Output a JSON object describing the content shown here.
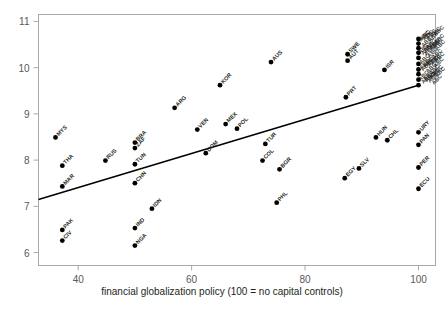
{
  "chart_data": {
    "type": "scatter",
    "title": "",
    "xlabel": "financial globalization policy (100 = no capital controls)",
    "ylabel": "",
    "xlim": [
      33,
      103
    ],
    "ylim": [
      5.72,
      11.15
    ],
    "xticks": [
      40,
      60,
      80,
      100
    ],
    "yticks": [
      6,
      7,
      8,
      9,
      10,
      11
    ],
    "grid": false,
    "legend": false,
    "trendline": {
      "label": "linear fit",
      "x_start": 33.0,
      "y_start": 7.15,
      "x_end": 100.0,
      "y_end": 9.62
    },
    "points": [
      {
        "label": "MYS",
        "x": 36.0,
        "y": 8.49
      },
      {
        "label": "THA",
        "x": 37.2,
        "y": 7.88
      },
      {
        "label": "MAR",
        "x": 37.2,
        "y": 7.43
      },
      {
        "label": "PAK",
        "x": 37.2,
        "y": 6.49
      },
      {
        "label": "CIV",
        "x": 37.2,
        "y": 6.26
      },
      {
        "label": "RUS",
        "x": 44.8,
        "y": 7.99
      },
      {
        "label": "BRA",
        "x": 50.0,
        "y": 8.38
      },
      {
        "label": "ZAF",
        "x": 50.0,
        "y": 8.26
      },
      {
        "label": "TUN",
        "x": 50.0,
        "y": 7.91
      },
      {
        "label": "CHN",
        "x": 50.0,
        "y": 7.5
      },
      {
        "label": "IND",
        "x": 50.0,
        "y": 6.53
      },
      {
        "label": "NGA",
        "x": 50.0,
        "y": 6.15
      },
      {
        "label": "IDN",
        "x": 53.0,
        "y": 6.95
      },
      {
        "label": "ARG",
        "x": 57.0,
        "y": 9.13
      },
      {
        "label": "VEN",
        "x": 61.0,
        "y": 8.66
      },
      {
        "label": "DOM",
        "x": 62.5,
        "y": 8.15
      },
      {
        "label": "MEX",
        "x": 66.0,
        "y": 8.78
      },
      {
        "label": "POL",
        "x": 68.0,
        "y": 8.68
      },
      {
        "label": "KOR",
        "x": 65.0,
        "y": 9.62
      },
      {
        "label": "AUS",
        "x": 74.0,
        "y": 10.12
      },
      {
        "label": "TUR",
        "x": 73.0,
        "y": 8.35
      },
      {
        "label": "COL",
        "x": 72.5,
        "y": 7.99
      },
      {
        "label": "BGR",
        "x": 75.5,
        "y": 7.8
      },
      {
        "label": "PHL",
        "x": 75.0,
        "y": 7.08
      },
      {
        "label": "SWE",
        "x": 87.5,
        "y": 10.29
      },
      {
        "label": "AUT",
        "x": 87.5,
        "y": 10.15
      },
      {
        "label": "PRT",
        "x": 87.2,
        "y": 9.36
      },
      {
        "label": "EGY",
        "x": 87.0,
        "y": 7.61
      },
      {
        "label": "SLV",
        "x": 89.5,
        "y": 7.82
      },
      {
        "label": "HUN",
        "x": 92.5,
        "y": 8.49
      },
      {
        "label": "CHL",
        "x": 94.5,
        "y": 8.43
      },
      {
        "label": "ISR",
        "x": 94.0,
        "y": 9.95
      },
      {
        "label": "URY",
        "x": 100.0,
        "y": 8.6
      },
      {
        "label": "PAN",
        "x": 100.0,
        "y": 8.33
      },
      {
        "label": "PER",
        "x": 100.0,
        "y": 7.84
      },
      {
        "label": "ECU",
        "x": 100.0,
        "y": 7.38
      },
      {
        "label": "HIC-1",
        "x": 100.0,
        "y": 10.62
      },
      {
        "label": "HIC-2",
        "x": 100.0,
        "y": 10.52
      },
      {
        "label": "HIC-3",
        "x": 100.0,
        "y": 10.42
      },
      {
        "label": "HIC-4",
        "x": 100.0,
        "y": 10.32
      },
      {
        "label": "HIC-5",
        "x": 100.0,
        "y": 10.21
      },
      {
        "label": "HIC-6",
        "x": 100.0,
        "y": 10.08
      },
      {
        "label": "HIC-7",
        "x": 100.0,
        "y": 9.96
      },
      {
        "label": "HIC-8",
        "x": 100.0,
        "y": 9.86
      },
      {
        "label": "HIC-9",
        "x": 100.0,
        "y": 9.74
      },
      {
        "label": "HIC-10",
        "x": 100.0,
        "y": 9.62
      }
    ],
    "dense_cluster_note": "overlapping high-income country labels at x=100"
  }
}
